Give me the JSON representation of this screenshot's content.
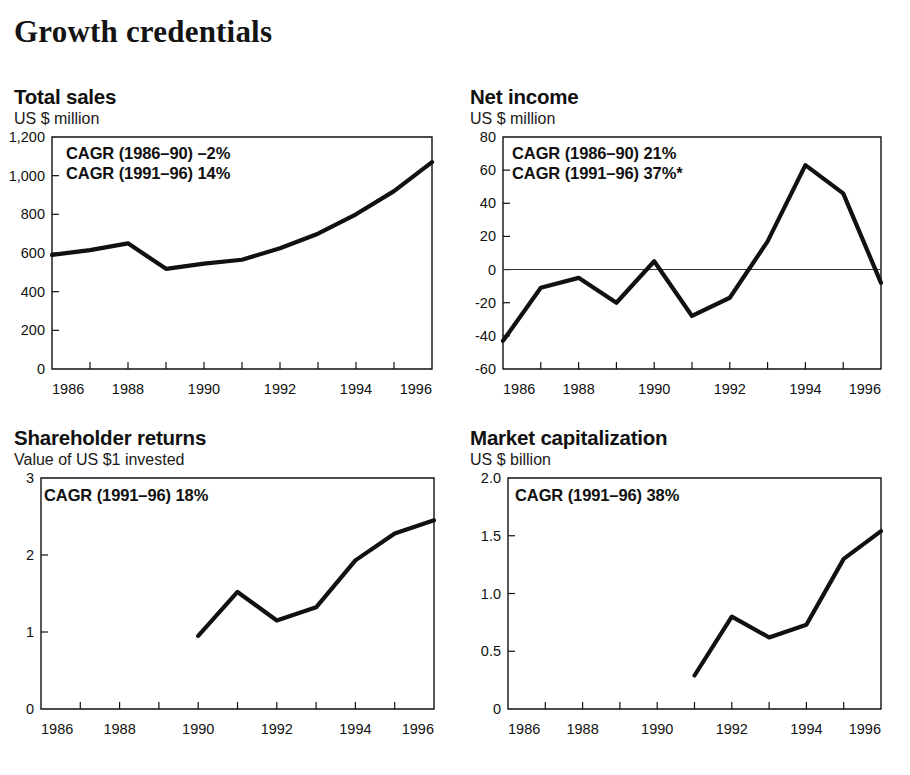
{
  "header": {
    "title": "Growth credentials"
  },
  "charts": [
    {
      "id": "total-sales",
      "title": "Total sales",
      "subtitle": "US $ million",
      "annotations": [
        "CAGR (1986–90) –2%",
        "CAGR (1991–96) 14%"
      ],
      "chart_data": {
        "type": "line",
        "title": "Total sales",
        "xlabel": "",
        "ylabel": "US $ million",
        "x": [
          1986,
          1987,
          1988,
          1989,
          1990,
          1991,
          1992,
          1993,
          1994,
          1995,
          1996
        ],
        "values": [
          590,
          615,
          650,
          518,
          545,
          565,
          625,
          700,
          800,
          920,
          1070
        ],
        "ylim": [
          0,
          1200
        ],
        "xlim": [
          1986,
          1996
        ],
        "yticks": [
          0,
          200,
          400,
          600,
          800,
          1000,
          1200
        ],
        "yticklabels": [
          "0",
          "200",
          "400",
          "600",
          "800",
          "1,000",
          "1,200"
        ],
        "xticks": [
          1986,
          1988,
          1990,
          1992,
          1994,
          1996
        ],
        "xticklabels": [
          "1986",
          "1988",
          "1990",
          "1992",
          "1994",
          "1996"
        ],
        "grid": false,
        "legend": "none"
      }
    },
    {
      "id": "net-income",
      "title": "Net income",
      "subtitle": "US $ million",
      "annotations": [
        "CAGR (1986–90) 21%",
        "CAGR (1991–96) 37%*"
      ],
      "chart_data": {
        "type": "line",
        "title": "Net income",
        "xlabel": "",
        "ylabel": "US $ million",
        "x": [
          1986,
          1987,
          1988,
          1989,
          1990,
          1991,
          1992,
          1993,
          1994,
          1995,
          1996
        ],
        "values": [
          -43,
          -11,
          -5,
          -20,
          5,
          -28,
          -17,
          17,
          63,
          46,
          -8
        ],
        "ylim": [
          -60,
          80
        ],
        "xlim": [
          1986,
          1996
        ],
        "yticks": [
          -60,
          -40,
          -20,
          0,
          20,
          40,
          60,
          80
        ],
        "yticklabels": [
          "-60",
          "-40",
          "-20",
          "0",
          "20",
          "40",
          "60",
          "80"
        ],
        "xticks": [
          1986,
          1988,
          1990,
          1992,
          1994,
          1996
        ],
        "xticklabels": [
          "1986",
          "1988",
          "1990",
          "1992",
          "1994",
          "1996"
        ],
        "grid": false,
        "legend": "none",
        "zero_reference_line": true
      }
    },
    {
      "id": "shareholder-returns",
      "title": "Shareholder returns",
      "subtitle": "Value of US $1 invested",
      "annotations": [
        "CAGR (1991–96) 18%"
      ],
      "chart_data": {
        "type": "line",
        "title": "Shareholder returns",
        "xlabel": "",
        "ylabel": "Value of US $1 invested",
        "x": [
          1990,
          1991,
          1992,
          1993,
          1994,
          1995,
          1996
        ],
        "values": [
          0.95,
          1.52,
          1.15,
          1.32,
          1.93,
          2.28,
          2.45
        ],
        "ylim": [
          0,
          3
        ],
        "xlim": [
          1986,
          1996
        ],
        "yticks": [
          0,
          1,
          2,
          3
        ],
        "yticklabels": [
          "0",
          "1",
          "2",
          "3"
        ],
        "xticks": [
          1986,
          1988,
          1990,
          1992,
          1994,
          1996
        ],
        "xticklabels": [
          "1986",
          "1988",
          "1990",
          "1992",
          "1994",
          "1996"
        ],
        "grid": false,
        "legend": "none"
      }
    },
    {
      "id": "market-capitalization",
      "title": "Market capitalization",
      "subtitle": "US $ billion",
      "annotations": [
        "CAGR (1991–96) 38%"
      ],
      "chart_data": {
        "type": "line",
        "title": "Market capitalization",
        "xlabel": "",
        "ylabel": "US $ billion",
        "x": [
          1991,
          1992,
          1993,
          1994,
          1995,
          1996
        ],
        "values": [
          0.29,
          0.8,
          0.62,
          0.73,
          1.3,
          1.54
        ],
        "ylim": [
          0,
          2.0
        ],
        "xlim": [
          1986,
          1996
        ],
        "yticks": [
          0,
          0.5,
          1.0,
          1.5,
          2.0
        ],
        "yticklabels": [
          "0",
          "0.5",
          "1.0",
          "1.5",
          "2.0"
        ],
        "xticks": [
          1986,
          1988,
          1990,
          1992,
          1994,
          1996
        ],
        "xticklabels": [
          "1986",
          "1988",
          "1990",
          "1992",
          "1994",
          "1996"
        ],
        "grid": false,
        "legend": "none"
      }
    }
  ],
  "colors": {
    "ink": "#111111",
    "background": "#ffffff",
    "series": "#111111"
  }
}
